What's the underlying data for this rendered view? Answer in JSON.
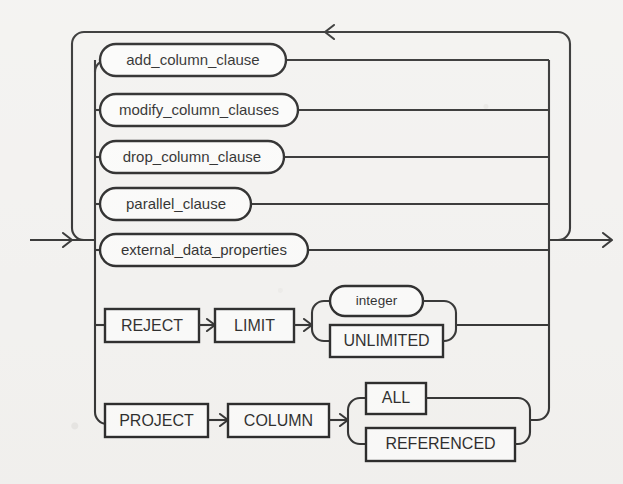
{
  "diagram": {
    "type": "railroad-syntax-diagram",
    "name": "alter_external_table_clauses",
    "background_color": "#f2f1ef",
    "line_color": "#1b1b1b",
    "box_fill_color": "#fbfbfa",
    "entry_label": "",
    "exit_label": ""
  },
  "alternatives": [
    {
      "id": "add_column_clause",
      "label": "add_column_clause",
      "shape": "rounded-nonterminal",
      "row": 1
    },
    {
      "id": "modify_column_clauses",
      "label": "modify_column_clauses",
      "shape": "rounded-nonterminal",
      "row": 2
    },
    {
      "id": "drop_column_clause",
      "label": "drop_column_clause",
      "shape": "rounded-nonterminal",
      "row": 3
    },
    {
      "id": "parallel_clause",
      "label": "parallel_clause",
      "shape": "rounded-nonterminal",
      "row": 4
    },
    {
      "id": "external_data_properties",
      "label": "external_data_properties",
      "shape": "rounded-nonterminal",
      "row": 5
    }
  ],
  "reject_limit_row": {
    "keyword_1": "REJECT",
    "keyword_2": "LIMIT",
    "options": [
      {
        "id": "integer",
        "label": "integer",
        "shape": "rounded-nonterminal"
      },
      {
        "id": "unlimited",
        "label": "UNLIMITED",
        "shape": "rect-keyword"
      }
    ]
  },
  "project_column_row": {
    "keyword_1": "PROJECT",
    "keyword_2": "COLUMN",
    "options": [
      {
        "id": "all",
        "label": "ALL",
        "shape": "rect-keyword"
      },
      {
        "id": "referenced",
        "label": "REFERENCED",
        "shape": "rect-keyword"
      }
    ]
  },
  "loop": {
    "direction": "right-to-left",
    "arrow_glyph": "<"
  }
}
